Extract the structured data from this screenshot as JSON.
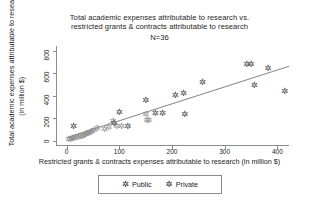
{
  "chart_data": {
    "type": "scatter",
    "title": "Total academic expenses attributable to research vs. restricted grants & contracts attributable to research",
    "title_line1": "Total academic expenses attributable to research vs.",
    "title_line2": "restricted grants & contracts attributable to research",
    "annotation": "N=36",
    "xlabel": "Restricted grants & contracts expenses attributable to research (in million $)",
    "ylabel_line1": "Total academic expenses attributable to research",
    "ylabel_line2": "(in million $)",
    "xlim": [
      -20,
      420
    ],
    "ylim": [
      -40,
      840
    ],
    "xticks": [
      0,
      100,
      200,
      300,
      400
    ],
    "yticks": [
      0,
      200,
      400,
      600,
      800
    ],
    "grid": false,
    "legend_position": "bottom",
    "colors": {
      "public": "#8d8d8d",
      "private": "#3b3b3b",
      "axis": "#8c8c8c",
      "fit": "#8c8c8c"
    },
    "marker_glyph": "✲",
    "series": [
      {
        "name": "Public",
        "color": "#8d8d8d",
        "points": [
          [
            4,
            8
          ],
          [
            8,
            12
          ],
          [
            11,
            18
          ],
          [
            14,
            22
          ],
          [
            18,
            25
          ],
          [
            22,
            30
          ],
          [
            26,
            34
          ],
          [
            30,
            40
          ],
          [
            33,
            44
          ],
          [
            36,
            52
          ],
          [
            39,
            58
          ],
          [
            42,
            66
          ],
          [
            45,
            74
          ],
          [
            48,
            82
          ],
          [
            52,
            92
          ],
          [
            58,
            104
          ],
          [
            72,
            96
          ],
          [
            80,
            118
          ],
          [
            88,
            170
          ],
          [
            95,
            128
          ],
          [
            104,
            126
          ],
          [
            150,
            232
          ],
          [
            152,
            180
          ],
          [
            156,
            178
          ]
        ]
      },
      {
        "name": "Private",
        "color": "#3b3b3b",
        "points": [
          [
            13,
            126
          ],
          [
            90,
            152
          ],
          [
            100,
            250
          ],
          [
            116,
            128
          ],
          [
            150,
            352
          ],
          [
            168,
            236
          ],
          [
            182,
            236
          ],
          [
            206,
            398
          ],
          [
            222,
            414
          ],
          [
            224,
            234
          ],
          [
            258,
            516
          ],
          [
            342,
            672
          ],
          [
            350,
            674
          ],
          [
            356,
            492
          ],
          [
            382,
            644
          ],
          [
            414,
            438
          ]
        ]
      }
    ],
    "fit_line": {
      "x0": 0,
      "y0": 28,
      "x1": 420,
      "y1": 660
    }
  },
  "legend": {
    "items": [
      {
        "label": "Public",
        "marker": "✲",
        "color": "#8d8d8d"
      },
      {
        "label": "Private",
        "marker": "✲",
        "color": "#3b3b3b"
      }
    ]
  }
}
